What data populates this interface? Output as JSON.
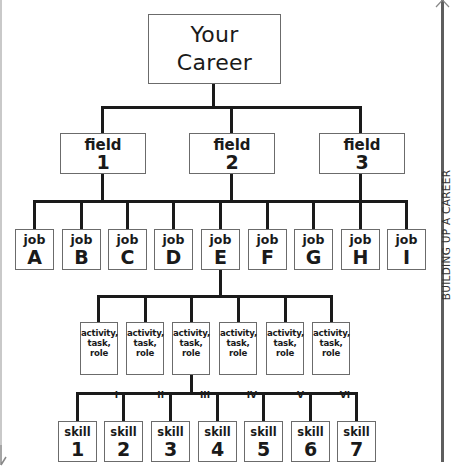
{
  "root": {
    "line1": "Your",
    "line2": "Career"
  },
  "fields": [
    {
      "label": "field",
      "num": "1"
    },
    {
      "label": "field",
      "num": "2"
    },
    {
      "label": "field",
      "num": "3"
    }
  ],
  "jobs": [
    {
      "label": "job",
      "letter": "A"
    },
    {
      "label": "job",
      "letter": "B"
    },
    {
      "label": "job",
      "letter": "C"
    },
    {
      "label": "job",
      "letter": "D"
    },
    {
      "label": "job",
      "letter": "E"
    },
    {
      "label": "job",
      "letter": "F"
    },
    {
      "label": "job",
      "letter": "G"
    },
    {
      "label": "job",
      "letter": "H"
    },
    {
      "label": "job",
      "letter": "I"
    }
  ],
  "activities": [
    {
      "l1": "activity,",
      "l2": "task,",
      "l3": "role",
      "numeral": "I"
    },
    {
      "l1": "activity,",
      "l2": "task,",
      "l3": "role",
      "numeral": "II"
    },
    {
      "l1": "activity,",
      "l2": "task,",
      "l3": "role",
      "numeral": "III"
    },
    {
      "l1": "activity,",
      "l2": "task,",
      "l3": "role",
      "numeral": "IV"
    },
    {
      "l1": "activity,",
      "l2": "task,",
      "l3": "role",
      "numeral": "V"
    },
    {
      "l1": "activity,",
      "l2": "task,",
      "l3": "role",
      "numeral": "VI"
    }
  ],
  "skills": [
    {
      "label": "skill",
      "num": "1"
    },
    {
      "label": "skill",
      "num": "2"
    },
    {
      "label": "skill",
      "num": "3"
    },
    {
      "label": "skill",
      "num": "4"
    },
    {
      "label": "skill",
      "num": "5"
    },
    {
      "label": "skill",
      "num": "6"
    },
    {
      "label": "skill",
      "num": "7"
    }
  ],
  "side_axis": {
    "label": "BUILDING UP A CAREER",
    "color": "#5e5e5e"
  }
}
